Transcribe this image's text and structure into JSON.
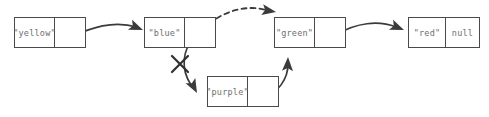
{
  "diagram": {
    "type": "linked-list",
    "canvas": {
      "width": 489,
      "height": 117
    },
    "colors": {
      "background": "#ffffff",
      "node_border": "#4a4a4a",
      "text": "#6e6e6e",
      "arrow": "#3b3b3b",
      "dashed_arrow": "#3b3b3b",
      "cross_out": "#2e2e2e"
    },
    "nodes": [
      {
        "id": "yellow",
        "value_label": "\"yellow\"",
        "next_label": "",
        "x": 14,
        "y": 17,
        "width": 72,
        "height": 31,
        "value_cell_width": 40
      },
      {
        "id": "blue",
        "value_label": "\"blue\"",
        "next_label": "",
        "x": 144,
        "y": 17,
        "width": 72,
        "height": 31,
        "value_cell_width": 40
      },
      {
        "id": "green",
        "value_label": "\"green\"",
        "next_label": "",
        "x": 274,
        "y": 17,
        "width": 72,
        "height": 31,
        "value_cell_width": 40
      },
      {
        "id": "red",
        "value_label": "\"red\"",
        "next_label": "null",
        "x": 408,
        "y": 17,
        "width": 72,
        "height": 31,
        "value_cell_width": 37
      },
      {
        "id": "purple",
        "value_label": "\"purple\"",
        "next_label": "",
        "x": 207,
        "y": 76,
        "width": 72,
        "height": 31,
        "value_cell_width": 40
      }
    ],
    "edges": [
      {
        "id": "yellow-to-blue",
        "from": "yellow",
        "to": "blue",
        "style": "solid",
        "crossed_out": false,
        "path": "M 72 36 C 92 28, 112 20, 137 27",
        "dot": {
          "cx": 72,
          "cy": 36
        },
        "arrow": {
          "x": 142,
          "y": 30,
          "angle": 28
        }
      },
      {
        "id": "blue-to-purple",
        "from": "blue",
        "to": "purple",
        "style": "solid",
        "crossed_out": true,
        "path": "M 194 37 C 183 50, 180 68, 192 86",
        "dot": {
          "cx": 194,
          "cy": 37
        },
        "arrow": {
          "x": 196,
          "y": 92,
          "angle": 62
        },
        "cross": {
          "cx": 180,
          "cy": 64,
          "size": 9
        }
      },
      {
        "id": "blue-to-green-new",
        "from": "blue",
        "to": "green",
        "style": "dashed",
        "crossed_out": false,
        "path": "M 197 36 C 213 14, 245 3, 268 11",
        "dot": {
          "cx": 197,
          "cy": 36
        },
        "arrow": {
          "x": 274,
          "y": 11,
          "angle": 15
        }
      },
      {
        "id": "purple-to-green",
        "from": "purple",
        "to": "green",
        "style": "solid",
        "crossed_out": false,
        "path": "M 264 97 C 277 92, 287 78, 288 64",
        "dot": {
          "cx": 264,
          "cy": 97
        },
        "arrow": {
          "x": 288,
          "y": 57,
          "angle": -85
        }
      },
      {
        "id": "green-to-red",
        "from": "green",
        "to": "red",
        "style": "solid",
        "crossed_out": false,
        "path": "M 338 34 C 356 23, 378 20, 398 27",
        "dot": {
          "cx": 338,
          "cy": 34
        },
        "arrow": {
          "x": 403,
          "y": 30,
          "angle": 28
        }
      }
    ]
  }
}
